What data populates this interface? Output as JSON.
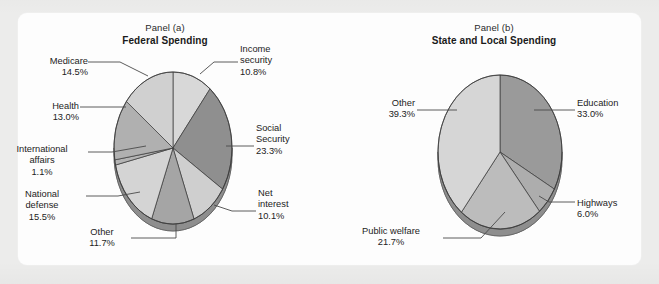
{
  "figure": {
    "background_color": "#ececeb",
    "card_color": "#fdfdfd"
  },
  "panels": [
    {
      "id": "panel-a",
      "caption": "Panel (a)",
      "title": "Federal Spending"
    },
    {
      "id": "panel-b",
      "caption": "Panel (b)",
      "title": "State and Local Spending"
    }
  ],
  "chart_data": [
    {
      "type": "pie",
      "title": "Federal Spending",
      "subtitle": "Panel (a)",
      "labels": [
        "Income security",
        "Social Security",
        "Net interest",
        "Other",
        "National defense",
        "International affairs",
        "Health",
        "Medicare"
      ],
      "values": [
        10.8,
        23.3,
        10.1,
        11.7,
        15.5,
        1.1,
        13.0,
        14.5
      ],
      "value_labels": [
        "10.8%",
        "23.3%",
        "10.1%",
        "11.7%",
        "15.5%",
        "1.1%",
        "13.0%",
        "14.5%"
      ],
      "colors": [
        "#d8d8d8",
        "#8f8f8f",
        "#cfcfcf",
        "#a5a5a5",
        "#d4d4d4",
        "#b4b4b4",
        "#b0b0b0",
        "#d0d0d0"
      ],
      "start_angle_deg": 0,
      "direction": "clockwise",
      "legend": "none",
      "units": "percent of total spending"
    },
    {
      "type": "pie",
      "title": "State and Local Spending",
      "subtitle": "Panel (b)",
      "labels": [
        "Education",
        "Highways",
        "Public welfare",
        "Other"
      ],
      "values": [
        33.0,
        6.0,
        21.7,
        39.3
      ],
      "value_labels": [
        "33.0%",
        "6.0%",
        "21.7%",
        "39.3%"
      ],
      "colors": [
        "#9a9a9a",
        "#adadad",
        "#bcbcbc",
        "#d6d6d6"
      ],
      "start_angle_deg": 0,
      "direction": "clockwise",
      "legend": "none",
      "units": "percent of total spending"
    }
  ],
  "labels_a": {
    "income_security": {
      "name": "Income",
      "name2": "security",
      "pct": "10.8%"
    },
    "social_security": {
      "name": "Social",
      "name2": "Security",
      "pct": "23.3%"
    },
    "net_interest": {
      "name": "Net",
      "name2": "interest",
      "pct": "10.1%"
    },
    "other": {
      "name": "Other",
      "pct": "11.7%"
    },
    "national_defense": {
      "name": "National",
      "name2": "defense",
      "pct": "15.5%"
    },
    "international_affairs": {
      "name": "International",
      "name2": "affairs",
      "pct": "1.1%"
    },
    "health": {
      "name": "Health",
      "pct": "13.0%"
    },
    "medicare": {
      "name": "Medicare",
      "pct": "14.5%"
    }
  },
  "labels_b": {
    "education": {
      "name": "Education",
      "pct": "33.0%"
    },
    "highways": {
      "name": "Highways",
      "pct": "6.0%"
    },
    "public_welfare": {
      "name": "Public welfare",
      "pct": "21.7%"
    },
    "other": {
      "name": "Other",
      "pct": "39.3%"
    }
  }
}
